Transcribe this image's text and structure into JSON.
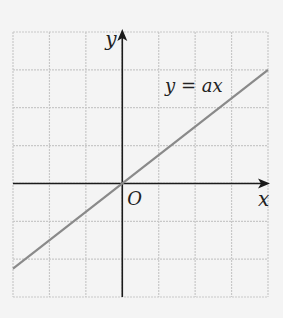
{
  "chart_data": {
    "type": "line",
    "title": "",
    "function_label": "y = ax",
    "slope_estimate": 0.75,
    "xlabel": "x",
    "ylabel": "y",
    "origin_label": "O",
    "xlim": [
      -3,
      4
    ],
    "ylim": [
      -3,
      4
    ],
    "grid": true,
    "series": [
      {
        "name": "y = ax",
        "x": [
          -3,
          4
        ],
        "y": [
          -2.25,
          3
        ]
      }
    ]
  },
  "colors": {
    "background": "#f4f4f4",
    "grid": "#c8c8c8",
    "axes": "#1a1a1a",
    "line": "#8a8a8a"
  }
}
